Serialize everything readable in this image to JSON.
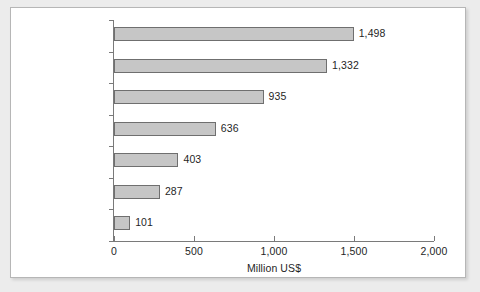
{
  "page": {
    "background_color": "#ececec",
    "clipped_text_fragment": "    "
  },
  "panel": {
    "background_color": "#ffffff",
    "border_color": "#b6b6b6"
  },
  "chart_data": {
    "type": "bar",
    "orientation": "horizontal",
    "title": "",
    "xlabel": "Million US$",
    "ylabel": "",
    "categories": [
      "Athens 2004",
      "Sydney 2000",
      "Atlanta 1996",
      "Barcelona 1992",
      "Seoul 1988",
      "Los Angeles 1984",
      "Moscow 1980"
    ],
    "values": [
      1498,
      1332,
      935,
      636,
      403,
      287,
      101
    ],
    "value_labels": [
      "1,498",
      "1,332",
      "935",
      "636",
      "403",
      "287",
      "101"
    ],
    "xlim": [
      0,
      2000
    ],
    "xticks": [
      0,
      500,
      1000,
      1500,
      2000
    ],
    "xtick_labels": [
      "0",
      "500",
      "1,000",
      "1,500",
      "2,000"
    ],
    "grid": false,
    "legend": false,
    "bar_fill_color": "#c6c6c6",
    "bar_edge_color": "#6f6f6f",
    "axis_color": "#7a7a7a",
    "text_color": "#1f1f1f"
  }
}
